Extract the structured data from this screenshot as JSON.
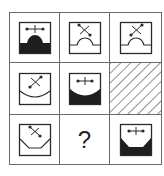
{
  "puzzle": {
    "type": "3x3 visual reasoning matrix",
    "question_mark": "?",
    "colors": {
      "line": "#2a2a2a",
      "fill": "#1e1e1e",
      "grid": "#6a6a6a",
      "hatch": "#444444"
    },
    "cells": [
      {
        "row": 1,
        "col": 1,
        "symbol": "horizontal-cross",
        "bottom_shape": "bump-up",
        "filled": true
      },
      {
        "row": 1,
        "col": 2,
        "symbol": "x-diagonal-backslash",
        "bottom_shape": "bump-up",
        "filled": false
      },
      {
        "row": 1,
        "col": 3,
        "symbol": "x-diagonal-slash",
        "bottom_shape": "bump-up",
        "filled": false
      },
      {
        "row": 2,
        "col": 1,
        "symbol": "x-diagonal-slash",
        "bottom_shape": "concave-arc",
        "filled": false
      },
      {
        "row": 2,
        "col": 2,
        "symbol": "horizontal-cross",
        "bottom_shape": "concave-arc",
        "filled": true
      },
      {
        "row": 2,
        "col": 3,
        "symbol": "hatched",
        "bottom_shape": "none",
        "filled": false
      },
      {
        "row": 3,
        "col": 1,
        "symbol": "x-diagonal-backslash",
        "bottom_shape": "trapezoid-notch",
        "filled": false
      },
      {
        "row": 3,
        "col": 2,
        "symbol": "unknown",
        "bottom_shape": "none",
        "filled": false
      },
      {
        "row": 3,
        "col": 3,
        "symbol": "horizontal-cross",
        "bottom_shape": "trapezoid-notch",
        "filled": true
      }
    ]
  }
}
